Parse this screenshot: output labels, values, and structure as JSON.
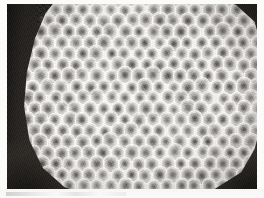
{
  "figure": {
    "kind": "micrograph-photograph",
    "color_mode": "grayscale",
    "width_px": 264,
    "height_px": 198,
    "caption": ""
  },
  "mount": {
    "label": "photo-mount",
    "background_color": "#fbfbf9",
    "border_width_px": 7
  },
  "plate": {
    "label": "photographic-plate",
    "left_px": 7,
    "top_px": 4,
    "width_px": 250,
    "height_px": 185,
    "background_color": "#2a2724"
  },
  "background": {
    "label": "dark-substrate",
    "color_dark": "#1c1a18",
    "color_mid": "#3a3632",
    "regions": [
      {
        "name": "left-band",
        "position": "left-edge"
      },
      {
        "name": "top-right-wedge",
        "position": "top-right-corner"
      },
      {
        "name": "bottom-left-mass",
        "position": "bottom-left-corner"
      },
      {
        "name": "bottom-right-mass",
        "position": "bottom-right-corner"
      }
    ]
  },
  "comb": {
    "label": "honeycomb-mass",
    "shape": "rounded-organic-blob",
    "rim_color": "#fdfdfb",
    "body_color": "#f2f1ee",
    "cell_shape": "hexagon",
    "cell_width_px": 12,
    "cell_height_px": 13.5,
    "row_spacing_px": 11,
    "col_spacing_px": 14,
    "rows": 18,
    "cols": 20,
    "cell_interior_color": "#6c6762",
    "cell_core_color": "#34302d",
    "approx_visible_cells": 270
  },
  "footer": {
    "label": "mount-footer-strip",
    "height_px": 9,
    "background_color": "#f8f8f6",
    "text": ""
  }
}
